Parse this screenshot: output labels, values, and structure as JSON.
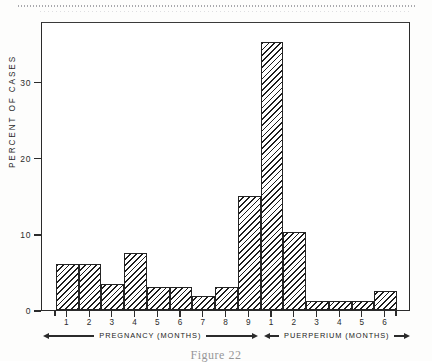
{
  "figure": {
    "caption": "Figure 22"
  },
  "chart_data": {
    "type": "bar",
    "title": "",
    "xlabel": "",
    "ylabel": "PERCENT OF CASES",
    "ylim": [
      0,
      38
    ],
    "y_ticks": [
      0,
      10,
      20,
      30
    ],
    "y_tick_labels": [
      "0",
      "10",
      "20",
      "30"
    ],
    "grid": false,
    "legend": null,
    "categories": [
      "1",
      "2",
      "3",
      "4",
      "5",
      "6",
      "7",
      "8",
      "9",
      "1",
      "2",
      "3",
      "4",
      "5",
      "6"
    ],
    "values": [
      6,
      6,
      3.4,
      7.5,
      3,
      3,
      1.8,
      3,
      15,
      35.2,
      10.2,
      1.2,
      1.2,
      1.2,
      2.5
    ],
    "groups": [
      {
        "label": "PREGNANCY   (MONTHS)",
        "name": "pregnancy",
        "categories": [
          "1",
          "2",
          "3",
          "4",
          "5",
          "6",
          "7",
          "8",
          "9"
        ],
        "values": [
          6,
          6,
          3.4,
          7.5,
          3,
          3,
          1.8,
          3,
          15
        ]
      },
      {
        "label": "PUERPERIUM  (MONTHS)",
        "name": "puerperium",
        "categories": [
          "1",
          "2",
          "3",
          "4",
          "5",
          "6"
        ],
        "values": [
          35.2,
          10.2,
          1.2,
          1.2,
          1.2,
          2.5
        ]
      }
    ]
  }
}
